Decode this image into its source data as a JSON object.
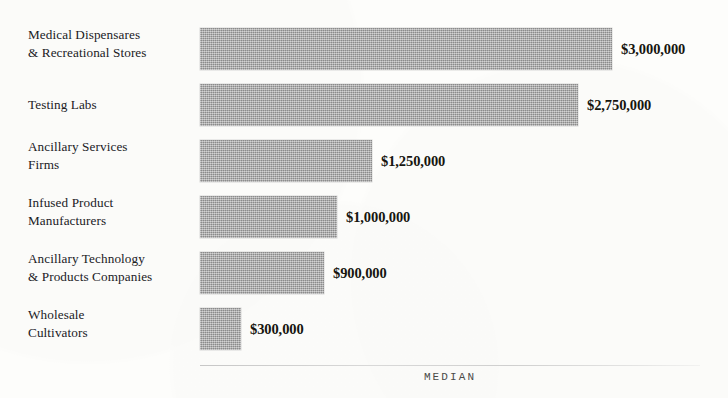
{
  "chart_data": {
    "type": "bar",
    "orientation": "horizontal",
    "title": "",
    "subtitle": "",
    "xlabel": "MEDIAN",
    "ylabel": "",
    "categories": [
      "Medical Dispensares\n& Recreational Stores",
      "Testing Labs",
      "Ancillary Services\nFirms",
      "Infused Product\nManufacturers",
      "Ancillary Technology\n& Products Companies",
      "Wholesale\nCultivators"
    ],
    "values": [
      3000000,
      2750000,
      1250000,
      1000000,
      900000,
      300000
    ],
    "value_labels": [
      "$3,000,000",
      "$2,750,000",
      "$1,250,000",
      "$1,000,000",
      "$900,000",
      "$300,000"
    ],
    "xlim": [
      0,
      3000000
    ],
    "grid": false,
    "legend": null,
    "bar_color": "#a9a9a9",
    "background_color": "#fdfdfb",
    "text_color": "#20201e"
  },
  "axis": {
    "label": "MEDIAN"
  },
  "rows": [
    {
      "label": "Medical Dispensares\n& Recreational Stores",
      "value_label": "$3,000,000"
    },
    {
      "label": "Testing Labs",
      "value_label": "$2,750,000"
    },
    {
      "label": "Ancillary Services\nFirms",
      "value_label": "$1,250,000"
    },
    {
      "label": "Infused Product\nManufacturers",
      "value_label": "$1,000,000"
    },
    {
      "label": "Ancillary Technology\n& Products Companies",
      "value_label": "$900,000"
    },
    {
      "label": "Wholesale\nCultivators",
      "value_label": "$300,000"
    }
  ]
}
